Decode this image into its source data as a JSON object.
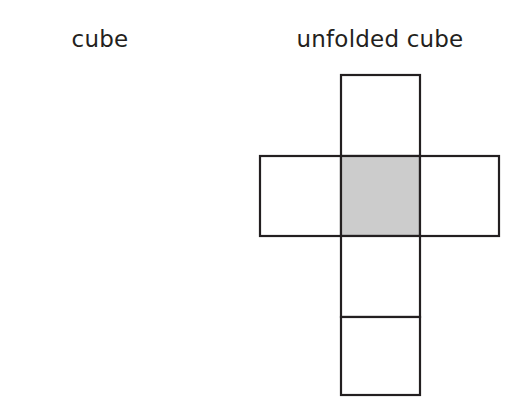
{
  "figure": {
    "title_left": "cube",
    "title_right": "unfolded cube",
    "background_color": "#ffffff",
    "stroke_color": "#231f20",
    "shaded_face_color": "#cccccc",
    "unshaded_face_color": "#ffffff",
    "stroke_width": 2.2
  },
  "cube": {
    "label": "cube",
    "faces": [
      {
        "name": "front-face",
        "fill": "#cccccc",
        "points": "35,150 116,150 116,223 35,223"
      },
      {
        "name": "top-face",
        "fill": "#ffffff",
        "points": "35,150 66,121 147,121 116,150"
      },
      {
        "name": "right-face",
        "fill": "#ffffff",
        "points": "116,150 147,121 147,194 116,223"
      }
    ],
    "shaded_face": "front-face",
    "shaded_face_count": 1,
    "total_faces_visible": 3
  },
  "unfolded_cube": {
    "label": "unfolded cube",
    "layout": "cross-net",
    "cell_size": 80,
    "columns": 3,
    "rows": 4,
    "cells": [
      {
        "name": "top-square",
        "row": 0,
        "col": 1,
        "fill": "#ffffff",
        "x": 341,
        "y": 75,
        "w": 79,
        "h": 81
      },
      {
        "name": "middle-left-square",
        "row": 1,
        "col": 0,
        "fill": "#ffffff",
        "x": 260,
        "y": 156,
        "w": 81,
        "h": 80
      },
      {
        "name": "middle-center-square",
        "row": 1,
        "col": 1,
        "fill": "#cccccc",
        "x": 341,
        "y": 156,
        "w": 79,
        "h": 80
      },
      {
        "name": "middle-right-square",
        "row": 1,
        "col": 2,
        "fill": "#ffffff",
        "x": 420,
        "y": 156,
        "w": 79,
        "h": 80
      },
      {
        "name": "lower-square",
        "row": 2,
        "col": 1,
        "fill": "#ffffff",
        "x": 341,
        "y": 236,
        "w": 79,
        "h": 81
      },
      {
        "name": "bottom-square",
        "row": 3,
        "col": 1,
        "fill": "#ffffff",
        "x": 341,
        "y": 317,
        "w": 79,
        "h": 78
      }
    ],
    "shaded_cell": "middle-center-square",
    "shaded_cell_count": 1,
    "total_cells": 6
  }
}
